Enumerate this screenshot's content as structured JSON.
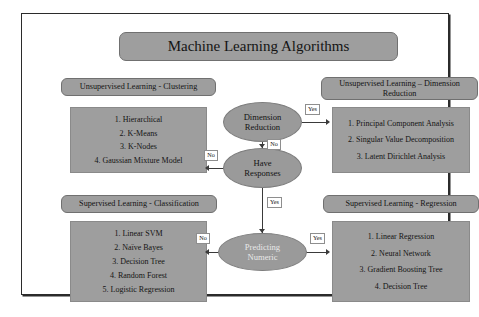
{
  "diagram": {
    "title": "Machine Learning Algorithms",
    "sections": {
      "clustering": {
        "header": "Unsupervised Learning - Clustering",
        "items": [
          "1. Hierarchical",
          "2. K-Means",
          "3. K-Nodes",
          "4. Gaussian Mixture Model"
        ]
      },
      "dimension_reduction": {
        "header_line1": "Unsupervised Learning – Dimension",
        "header_line2": "Reduction",
        "items": [
          "1. Principal Component Analysis",
          "2. Singular Value Decomposition",
          "3. Latent Dirichlet Analysis"
        ]
      },
      "classification": {
        "header": "Supervised Learning - Classification",
        "items": [
          "1. Linear SVM",
          "2. Naïve Bayes",
          "3. Decision Tree",
          "4. Random Forest",
          "5. Logistic Regression"
        ]
      },
      "regression": {
        "header": "Supervised Learning - Regression",
        "items": [
          "1. Linear Regression",
          "2. Neural Network",
          "3. Gradient Boosting Tree",
          "4. Decision Tree"
        ]
      }
    },
    "decision_nodes": [
      {
        "id": "dimension-reduction",
        "line1": "Dimension",
        "line2": "Reduction"
      },
      {
        "id": "have-responses",
        "line1": "Have",
        "line2": "Responses"
      },
      {
        "id": "predicting-numeric",
        "line1": "Predicting",
        "line2": "Numeric"
      }
    ],
    "edge_labels": {
      "dimred_yes": "Yes",
      "dimred_no": "No",
      "haveresp_no": "No",
      "haveresp_yes": "Yes",
      "prednum_no": "No",
      "prednum_yes": "Yes"
    },
    "colors": {
      "box_fill": "#9e9e9e",
      "node_fill": "#9a9a9a",
      "frame_border": "#2b2b2b",
      "connector": "#3a3a3a"
    }
  }
}
